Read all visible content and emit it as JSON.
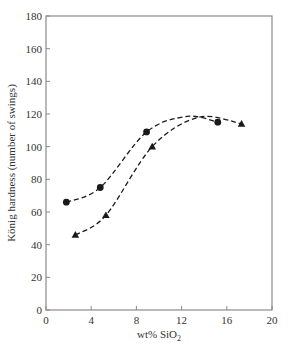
{
  "chart_data": {
    "type": "line",
    "title": "",
    "xlabel": "wt% SiO2",
    "xlabel_main": "wt% SiO",
    "xlabel_sub": "2",
    "ylabel": "König hardness (number of swings)",
    "xlim": [
      0,
      20
    ],
    "ylim": [
      0,
      180
    ],
    "xticks": [
      0,
      4,
      8,
      12,
      16,
      20
    ],
    "yticks": [
      0,
      20,
      40,
      60,
      80,
      100,
      120,
      140,
      160,
      180
    ],
    "grid": false,
    "legend": null,
    "series": [
      {
        "name": "circles",
        "marker": "circle",
        "line_style": "dashed",
        "x": [
          1.8,
          4.8,
          8.9,
          15.2
        ],
        "y": [
          66,
          75,
          109,
          115
        ]
      },
      {
        "name": "triangles",
        "marker": "triangle",
        "line_style": "dashed",
        "x": [
          2.6,
          5.3,
          9.4,
          17.3
        ],
        "y": [
          46,
          58,
          100,
          114
        ]
      }
    ]
  },
  "colors": {
    "axis": "#8a8a8a",
    "series": "#1a1a1a",
    "text": "#333333"
  }
}
